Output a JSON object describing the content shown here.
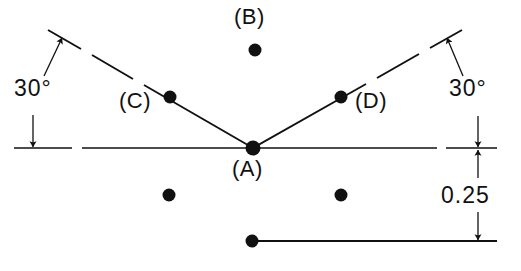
{
  "diagram": {
    "background_color": "#ffffff",
    "ink_color": "#111111",
    "points": [
      {
        "id": "A",
        "label": "(A)",
        "x": 253,
        "y": 148,
        "label_x": 232,
        "label_y": 158,
        "radius": 7.5,
        "role": "vertex"
      },
      {
        "id": "B",
        "label": "(B)",
        "x": 255,
        "y": 50,
        "label_x": 234,
        "label_y": 6,
        "radius": 6.5,
        "role": "upper"
      },
      {
        "id": "C",
        "label": "(C)",
        "x": 170,
        "y": 97,
        "label_x": 119,
        "label_y": 90,
        "radius": 6.5,
        "role": "left-arm"
      },
      {
        "id": "D",
        "label": "(D)",
        "x": 341,
        "y": 97,
        "label_x": 355,
        "label_y": 90,
        "radius": 6.5,
        "role": "right-arm"
      },
      {
        "id": "E",
        "label": "",
        "x": 169,
        "y": 195,
        "label_x": 0,
        "label_y": 0,
        "radius": 6.5,
        "role": "lower-left"
      },
      {
        "id": "F",
        "label": "",
        "x": 341,
        "y": 195,
        "label_x": 0,
        "label_y": 0,
        "radius": 6.5,
        "role": "lower-right"
      },
      {
        "id": "G",
        "label": "",
        "x": 252,
        "y": 241,
        "label_x": 0,
        "label_y": 0,
        "radius": 6.5,
        "role": "bottom-line-end"
      }
    ],
    "annotations": [
      {
        "id": "angle-left",
        "text": "30°",
        "x": 14,
        "y": 77
      },
      {
        "id": "angle-right",
        "text": "30°",
        "x": 449,
        "y": 77
      },
      {
        "id": "offset",
        "text": "0.25",
        "x": 441,
        "y": 184
      }
    ],
    "centerline": {
      "y": 148,
      "segments": [
        {
          "x1": 14,
          "x2": 72
        },
        {
          "x1": 82,
          "x2": 437
        },
        {
          "x1": 446,
          "x2": 497
        }
      ]
    },
    "bottom_line": {
      "y": 241,
      "x1": 252,
      "x2": 497
    },
    "arms": [
      {
        "id": "left-arm",
        "from": {
          "x": 253,
          "y": 148
        },
        "to": {
          "x": 48,
          "y": 30
        },
        "angle_deg": 30,
        "dashes": [
          {
            "x1": 253,
            "y1": 148,
            "x2": 144,
            "y2": 85
          },
          {
            "x1": 133,
            "y1": 79,
            "x2": 92,
            "y2": 55
          },
          {
            "x1": 81,
            "y1": 49,
            "x2": 48,
            "y2": 30
          }
        ]
      },
      {
        "id": "right-arm",
        "from": {
          "x": 253,
          "y": 148
        },
        "to": {
          "x": 462,
          "y": 30
        },
        "angle_deg": 30,
        "dashes": [
          {
            "x1": 253,
            "y1": 148,
            "x2": 366,
            "y2": 84
          },
          {
            "x1": 377,
            "y1": 78,
            "x2": 419,
            "y2": 54
          },
          {
            "x1": 430,
            "y1": 48,
            "x2": 462,
            "y2": 30
          }
        ]
      }
    ],
    "arrows": [
      {
        "id": "angle-left-arrow",
        "tip_x": 62,
        "tip_y": 38,
        "tail_x": 44,
        "tail_y": 76,
        "kind": "leader"
      },
      {
        "id": "angle-right-arrow",
        "tip_x": 447,
        "tip_y": 38,
        "tail_x": 463,
        "tail_y": 76,
        "kind": "leader"
      },
      {
        "id": "baseline-left-arrow",
        "tip_x": 33,
        "tip_y": 147,
        "tail_x": 33,
        "tail_y": 115,
        "kind": "leader"
      },
      {
        "id": "offset-top-arrow",
        "tip_x": 478,
        "tip_y": 147,
        "tail_x": 478,
        "tail_y": 116,
        "kind": "dimension"
      },
      {
        "id": "offset-bottom-arrow",
        "tip_x": 478,
        "tip_y": 149,
        "tail_x": 478,
        "tail_y": 178,
        "kind": "dimension"
      },
      {
        "id": "offset-lower-arrow",
        "tip_x": 478,
        "tip_y": 240,
        "tail_x": 478,
        "tail_y": 212,
        "kind": "dimension"
      }
    ]
  }
}
